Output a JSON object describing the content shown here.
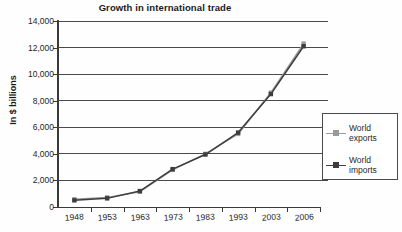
{
  "chart_data": {
    "type": "line",
    "title": "Growth in international trade",
    "xlabel": "",
    "ylabel": "In $ billions",
    "categories": [
      "1948",
      "1953",
      "1963",
      "1973",
      "1983",
      "1993",
      "2003",
      "2006"
    ],
    "series": [
      {
        "name": "World exports",
        "color": "#9a9a9a",
        "values": [
          580,
          720,
          1150,
          2800,
          4000,
          5500,
          8600,
          12300
        ]
      },
      {
        "name": "World imports",
        "color": "#3d3d3d",
        "values": [
          500,
          650,
          1200,
          2850,
          3950,
          5600,
          8500,
          12100
        ]
      }
    ],
    "ylim": [
      0,
      14000
    ],
    "ytick_values": [
      0,
      2000,
      4000,
      6000,
      8000,
      10000,
      12000,
      14000
    ],
    "ytick_labels": [
      "0",
      "2,000",
      "4,000",
      "6,000",
      "8,000",
      "10,000",
      "12,000",
      "14,000"
    ],
    "grid": "horizontal",
    "legend_position": "right",
    "marker": "square",
    "colors": {
      "grid": "#4a4a4a",
      "axis": "#3a3a3a",
      "text": "#1f1f1f",
      "background": "#fefefe",
      "legend_border": "#4a4a4a"
    }
  }
}
